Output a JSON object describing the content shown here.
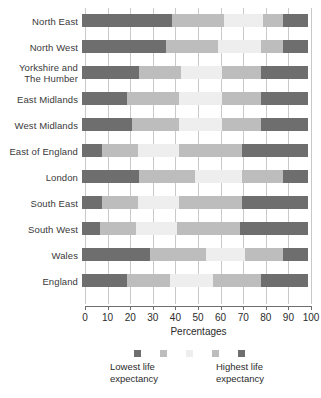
{
  "chart_data": {
    "type": "bar",
    "orientation": "horizontal",
    "stacked": true,
    "title": "",
    "xlabel": "Percentages",
    "ylabel": "",
    "xlim": [
      0,
      100
    ],
    "xticks": [
      0,
      10,
      20,
      30,
      40,
      50,
      60,
      70,
      80,
      90,
      100
    ],
    "grid": true,
    "legend_position": "bottom",
    "categories": [
      "North East",
      "North West",
      "Yorkshire and The Humber",
      "East Midlands",
      "West Midlands",
      "East of England",
      "London",
      "South East",
      "South West",
      "Wales",
      "England"
    ],
    "series": [
      {
        "name": "Lowest life expectancy",
        "color": "#6e6e6e",
        "values": [
          40,
          37,
          25,
          20,
          22,
          9,
          25,
          9,
          8,
          30,
          20
        ]
      },
      {
        "name": "Quintile 2",
        "color": "#bdbdbd",
        "values": [
          23,
          23,
          19,
          23,
          21,
          16,
          25,
          16,
          16,
          25,
          19
        ]
      },
      {
        "name": "Quintile 3",
        "color": "#eeeeee",
        "values": [
          17,
          19,
          18,
          19,
          19,
          18,
          21,
          18,
          18,
          17,
          19
        ]
      },
      {
        "name": "Quintile 4",
        "color": "#bdbdbd",
        "values": [
          9,
          10,
          17,
          17,
          17,
          28,
          18,
          28,
          28,
          17,
          21
        ]
      },
      {
        "name": "Highest life expectancy",
        "color": "#6e6e6e",
        "values": [
          11,
          11,
          21,
          21,
          21,
          29,
          11,
          29,
          30,
          11,
          21
        ]
      }
    ],
    "legend_entries": [
      {
        "label_line1": "Lowest life",
        "label_line2": "expectancy",
        "color": "#6e6e6e"
      },
      {
        "label_line1": "Highest life",
        "label_line2": "expectancy",
        "color": "#6e6e6e"
      }
    ],
    "legend_swatch_colors": [
      "#6e6e6e",
      "#bdbdbd",
      "#eeeeee",
      "#bdbdbd",
      "#6e6e6e"
    ]
  },
  "axis": {
    "x_title": "Percentages",
    "tick_labels": [
      "0",
      "10",
      "20",
      "30",
      "40",
      "50",
      "60",
      "70",
      "80",
      "90",
      "100"
    ]
  },
  "rows": [
    {
      "label_line1": "North East",
      "label_line2": ""
    },
    {
      "label_line1": "North West",
      "label_line2": ""
    },
    {
      "label_line1": "Yorkshire and",
      "label_line2": "The Humber"
    },
    {
      "label_line1": "East Midlands",
      "label_line2": ""
    },
    {
      "label_line1": "West Midlands",
      "label_line2": ""
    },
    {
      "label_line1": "East of England",
      "label_line2": ""
    },
    {
      "label_line1": "London",
      "label_line2": ""
    },
    {
      "label_line1": "South East",
      "label_line2": ""
    },
    {
      "label_line1": "South West",
      "label_line2": ""
    },
    {
      "label_line1": "Wales",
      "label_line2": ""
    },
    {
      "label_line1": "England",
      "label_line2": ""
    }
  ],
  "legend": {
    "left_line1": "Lowest life",
    "left_line2": "expectancy",
    "right_line1": "Highest life",
    "right_line2": "expectancy"
  }
}
